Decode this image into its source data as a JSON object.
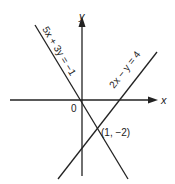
{
  "diagram": {
    "x_axis_label": "x",
    "y_axis_label": "y",
    "origin_label": "0",
    "line1": {
      "equation": "5x + 3y = −1"
    },
    "line2": {
      "equation": "2x − y = 4"
    },
    "intersection": {
      "label": "(1, −2)"
    },
    "colors": {
      "ink": "#222222",
      "background": "#ffffff"
    }
  }
}
